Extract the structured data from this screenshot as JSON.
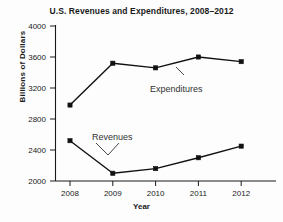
{
  "chart_data": {
    "type": "line",
    "title": "U.S. Revenues and Expenditures, 2008–2012",
    "xlabel": "Year",
    "ylabel": "Billions of Dollars",
    "categories": [
      "2008",
      "2009",
      "2010",
      "2011",
      "2012"
    ],
    "x": [
      2008,
      2009,
      2010,
      2011,
      2012
    ],
    "series": [
      {
        "name": "Expenditures",
        "values": [
          2980,
          3520,
          3460,
          3600,
          3540
        ]
      },
      {
        "name": "Revenues",
        "values": [
          2520,
          2100,
          2160,
          2300,
          2450
        ]
      }
    ],
    "ylim": [
      2000,
      4000
    ],
    "ytick_labels": [
      "4000",
      "3600",
      "3200",
      "2800",
      "2400",
      "2000"
    ],
    "ytick_values": [
      4000,
      3600,
      3200,
      2800,
      2400,
      2000
    ],
    "ytick_step": 400,
    "grid": false,
    "legend_position": "inline-annotations",
    "annotations": [
      {
        "label": "Expenditures",
        "points_to": "expenditures-2010"
      },
      {
        "label": "Revenues",
        "points_to": "revenues-2009"
      }
    ],
    "colors": {
      "line": "#111111",
      "marker": "#111111",
      "axis": "#1a1a1a",
      "text": "#1a1a1a",
      "background": "#fdfdfd"
    }
  }
}
